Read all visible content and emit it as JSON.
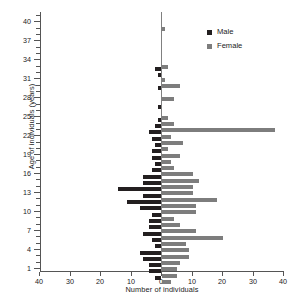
{
  "chart_data": {
    "type": "bar",
    "subtype": "population-pyramid",
    "title": "",
    "xlabel": "Number of individuals",
    "ylabel": "Age of individuals (years)",
    "xlim": [
      -40,
      40
    ],
    "ylim": [
      0,
      42
    ],
    "x_tick_labels": [
      "40",
      "30",
      "20",
      "10",
      "0",
      "10",
      "20",
      "30",
      "40"
    ],
    "x_tick_values": [
      -40,
      -30,
      -20,
      -10,
      0,
      10,
      20,
      30,
      40
    ],
    "y_tick_labels": [
      "1",
      "4",
      "7",
      "10",
      "13",
      "16",
      "19",
      "22",
      "25",
      "28",
      "31",
      "34",
      "37",
      "40"
    ],
    "y_tick_values": [
      1,
      4,
      7,
      10,
      13,
      16,
      19,
      22,
      25,
      28,
      31,
      34,
      37,
      40
    ],
    "y_minor_ticks": [
      2,
      3,
      5,
      6,
      8,
      9,
      11,
      12,
      14,
      15,
      17,
      18,
      20,
      21,
      23,
      24,
      26,
      27,
      29,
      30,
      32,
      33,
      35,
      36,
      38,
      39,
      41
    ],
    "grid": false,
    "legend_position": "top-right",
    "categories": [
      1,
      2,
      3,
      4,
      5,
      6,
      7,
      8,
      9,
      10,
      11,
      12,
      13,
      14,
      15,
      16,
      17,
      18,
      19,
      20,
      21,
      22,
      23,
      24,
      25,
      26,
      27,
      28,
      29,
      30,
      31,
      32,
      33,
      34,
      35,
      36,
      37,
      38,
      39,
      40,
      41
    ],
    "series": [
      {
        "name": "Male",
        "color": "#231f20",
        "direction": "left",
        "values": [
          2,
          4,
          4,
          6,
          7,
          2,
          3,
          6,
          4,
          4,
          3,
          7,
          11,
          6,
          14,
          6,
          6,
          3,
          2,
          3,
          3,
          2,
          3,
          4,
          2,
          1,
          0,
          1,
          0,
          0,
          1,
          0,
          1,
          2,
          0,
          0,
          0,
          0,
          0,
          0,
          0
        ]
      },
      {
        "name": "Female",
        "color": "#7d7d7d",
        "direction": "right",
        "values": [
          3,
          5,
          5,
          6,
          9,
          9,
          8,
          20,
          11,
          6,
          4,
          11,
          11,
          18,
          10,
          10,
          12,
          10,
          4,
          3,
          6,
          2,
          7,
          3,
          37,
          4,
          2,
          0,
          0,
          4,
          0,
          6,
          1,
          0,
          2,
          0,
          0,
          0,
          0,
          0,
          1
        ]
      }
    ]
  },
  "legend": {
    "items": [
      {
        "label": "Male",
        "swatch": "male"
      },
      {
        "label": "Female",
        "swatch": "female"
      }
    ]
  }
}
